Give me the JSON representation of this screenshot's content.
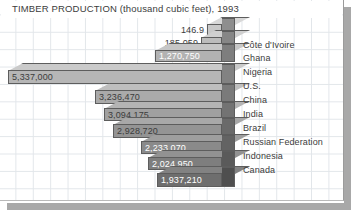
{
  "chart_data": {
    "type": "bar",
    "orientation": "horizontal",
    "title": "TIMBER PRODUCTION (thousand cubic feet), 1993",
    "xlabel": "",
    "ylabel": "",
    "units": "thousand cubic feet",
    "year": "1993",
    "grid": true,
    "legend": "none",
    "style": "3d-horizontal-bars-right-aligned",
    "categories": [
      "Côte d'Ivoire",
      "Ghana",
      "Nigeria",
      "U.S.",
      "China",
      "India",
      "Brazil",
      "Russian Federation",
      "Indonesia",
      "Canada"
    ],
    "values": [
      146.9,
      185059,
      1270750,
      5337000,
      3236470,
      3094175,
      2928720,
      2233070,
      2024950,
      1937210
    ],
    "value_labels": [
      "146.9",
      "185,059",
      "1,270,750",
      "5,337,000",
      "3,236,470",
      "3,094,175",
      "2,928,720",
      "2,233,070",
      "2,024,950",
      "1,937,210"
    ],
    "bars": [
      {
        "category": "Côte d'Ivoire",
        "value_label": "146.9",
        "left": 207,
        "top": 24,
        "height": 11,
        "fill": "#c8c8c8",
        "side": "#8e8e8e",
        "top_face": "#d8d8d8",
        "label_color": "#3c3c3c",
        "label_inside": false
      },
      {
        "category": "Ghana",
        "value_label": "185,059",
        "left": 201,
        "top": 37,
        "height": 11,
        "fill": "#bcbcbc",
        "side": "#868686",
        "top_face": "#cfcfcf",
        "label_color": "#3c3c3c",
        "label_inside": false
      },
      {
        "category": "Nigeria",
        "value_label": "1,270,750",
        "left": 155,
        "top": 50,
        "height": 12,
        "fill": "#b2b2b2",
        "side": "#7e7e7e",
        "top_face": "#c6c6c6",
        "label_color": "#ffffff",
        "label_inside": true
      },
      {
        "category": "U.S.",
        "value_label": "5,337,000",
        "left": 8,
        "top": 70,
        "height": 14,
        "fill": "#b6b6b6",
        "side": "#828282",
        "top_face": "#cacaca",
        "label_color": "#3c3c3c",
        "label_inside": true
      },
      {
        "category": "China",
        "value_label": "3,236,470",
        "left": 95,
        "top": 90,
        "height": 14,
        "fill": "#aaaaaa",
        "side": "#7a7a7a",
        "top_face": "#bebebe",
        "label_color": "#3c3c3c",
        "label_inside": true
      },
      {
        "category": "India",
        "value_label": "3,094,175",
        "left": 104,
        "top": 108,
        "height": 13,
        "fill": "#a0a0a0",
        "side": "#737373",
        "top_face": "#b4b4b4",
        "label_color": "#3c3c3c",
        "label_inside": true
      },
      {
        "category": "Brazil",
        "value_label": "2,928,720",
        "left": 113,
        "top": 124,
        "height": 14,
        "fill": "#949494",
        "side": "#6a6a6a",
        "top_face": "#a8a8a8",
        "label_color": "#3c3c3c",
        "label_inside": true
      },
      {
        "category": "Russian Federation",
        "value_label": "2,233,070",
        "left": 141,
        "top": 141,
        "height": 13,
        "fill": "#8a8a8a",
        "side": "#636363",
        "top_face": "#9e9e9e",
        "label_color": "#ffffff",
        "label_inside": true
      },
      {
        "category": "Indonesia",
        "value_label": "2,024,950",
        "left": 148,
        "top": 157,
        "height": 13,
        "fill": "#7e7e7e",
        "side": "#5a5a5a",
        "top_face": "#929292",
        "label_color": "#ffffff",
        "label_inside": true
      },
      {
        "category": "Canada",
        "value_label": "1,937,210",
        "left": 157,
        "top": 173,
        "height": 14,
        "fill": "#6e6e6e",
        "side": "#4f4f4f",
        "top_face": "#828282",
        "label_color": "#ffffff",
        "label_inside": true
      }
    ],
    "bar_right_edge": 222,
    "category_label_positions": [
      40,
      53,
      67,
      81,
      95,
      109,
      123,
      137,
      151,
      165
    ],
    "colors": {
      "background": "#ffffff",
      "grid_line": "#e2e6ea",
      "text": "#3c3c3c",
      "bar_outline": "#5d5d5d",
      "frame_shadow": "#a8a8a8"
    }
  }
}
